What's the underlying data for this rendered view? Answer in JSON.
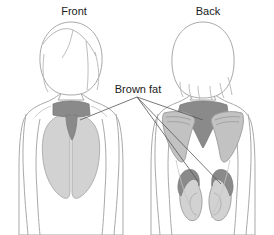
{
  "figure": {
    "title_front": "Front",
    "title_back": "Back",
    "callout_label": "Brown fat",
    "colors": {
      "background": "#ffffff",
      "outline": "#a9a9a9",
      "hair_line": "#b5b5b5",
      "brown_fat": "#8a8a8a",
      "brown_fat_dark_edge": "#7a7a7a",
      "organ_light": "#d2d2d2",
      "organ_mid": "#c2c2c2",
      "leader_line": "#555555",
      "text": "#1a1a1a"
    },
    "labels": [
      {
        "name": "front-view-label",
        "text": "Front",
        "x": 74,
        "y": 14
      },
      {
        "name": "back-view-label",
        "text": "Back",
        "x": 208,
        "y": 14
      },
      {
        "name": "brown-fat-label",
        "text": "Brown fat",
        "x": 138,
        "y": 93
      }
    ],
    "callout_origin": {
      "x": 137,
      "y": 97
    },
    "callout_targets": [
      {
        "name": "front-supraclavicular-fat",
        "x": 80,
        "y": 121
      },
      {
        "name": "back-interscapular-fat",
        "x": 205,
        "y": 122
      },
      {
        "name": "back-left-perirenal-fat",
        "x": 203,
        "y": 184
      },
      {
        "name": "back-right-perirenal-fat",
        "x": 222,
        "y": 186
      }
    ],
    "regions": [
      {
        "name": "supraclavicular-brown-fat",
        "view": "front",
        "tone": "dark"
      },
      {
        "name": "mediastinal-brown-fat",
        "view": "front",
        "tone": "dark"
      },
      {
        "name": "left-lung",
        "view": "front",
        "tone": "light"
      },
      {
        "name": "right-lung",
        "view": "front",
        "tone": "light"
      },
      {
        "name": "interscapular-brown-fat",
        "view": "back",
        "tone": "dark"
      },
      {
        "name": "left-scapula",
        "view": "back",
        "tone": "light"
      },
      {
        "name": "right-scapula",
        "view": "back",
        "tone": "light"
      },
      {
        "name": "left-kidney",
        "view": "back",
        "tone": "light"
      },
      {
        "name": "right-kidney",
        "view": "back",
        "tone": "light"
      },
      {
        "name": "left-perirenal-brown-fat",
        "view": "back",
        "tone": "dark"
      },
      {
        "name": "right-perirenal-brown-fat",
        "view": "back",
        "tone": "dark"
      }
    ]
  }
}
